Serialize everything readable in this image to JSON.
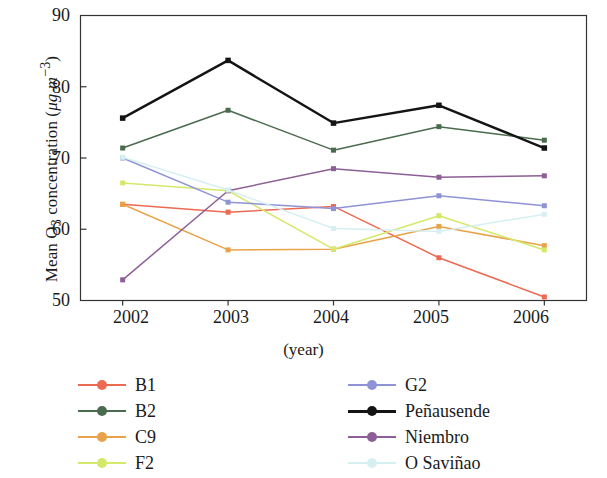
{
  "chart_data": {
    "type": "line",
    "title": "",
    "xlabel": "(year)",
    "ylabel": "Mean O3 concentration (μg m−3)",
    "ylabel_parts": {
      "prefix": "Mean O",
      "sub": "3",
      "middle": " concentration (",
      "unit_italic": "μg m",
      "unit_sup": "−3",
      "suffix": ")"
    },
    "categories": [
      "2002",
      "2003",
      "2004",
      "2005",
      "2006"
    ],
    "x": [
      2002,
      2003,
      2004,
      2005,
      2006
    ],
    "xlim": [
      2001.6,
      2006.4
    ],
    "ylim": [
      50,
      90
    ],
    "yticks": [
      "90",
      "80",
      "70",
      "60",
      "50"
    ],
    "ytick_values": [
      90,
      80,
      70,
      60,
      50
    ],
    "grid": false,
    "legend_position": "below-plot, two columns",
    "series": [
      {
        "name": "B1",
        "color": "#ec6a52",
        "values": [
          63.5,
          62.4,
          63.2,
          56.0,
          50.5
        ]
      },
      {
        "name": "B2",
        "color": "#4a6b4e",
        "values": [
          71.4,
          76.7,
          71.1,
          74.4,
          72.5
        ]
      },
      {
        "name": "C9",
        "color": "#e8a34a",
        "values": [
          63.5,
          57.1,
          57.2,
          60.4,
          57.7
        ]
      },
      {
        "name": "F2",
        "color": "#d5e86a",
        "values": [
          66.5,
          65.4,
          57.2,
          61.9,
          57.1
        ]
      },
      {
        "name": "G2",
        "color": "#8f93d6",
        "values": [
          70.0,
          63.8,
          62.9,
          64.7,
          63.3
        ]
      },
      {
        "name": "Peñausende",
        "color": "#141414",
        "values": [
          75.6,
          83.7,
          74.9,
          77.4,
          71.4
        ]
      },
      {
        "name": "Niembro",
        "color": "#8d5f96",
        "values": [
          52.9,
          65.4,
          68.5,
          67.3,
          67.5
        ]
      },
      {
        "name": "O Saviñao",
        "color": "#d6f0f2",
        "values": [
          70.1,
          65.5,
          60.1,
          59.7,
          62.1
        ]
      }
    ]
  },
  "legend": {
    "left_column": [
      "B1",
      "B2",
      "C9",
      "F2"
    ],
    "right_column": [
      "G2",
      "Peñausende",
      "Niembro",
      "O Saviñao"
    ]
  }
}
